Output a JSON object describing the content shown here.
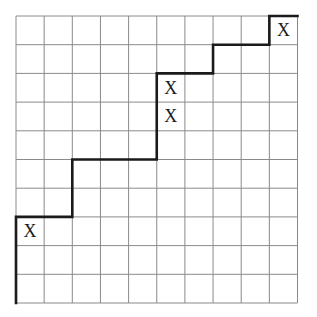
{
  "diagram": {
    "type": "lattice-path-grid",
    "grid": {
      "cols": 10,
      "rows": 10,
      "origin_x": 16,
      "origin_y": 16,
      "cell_w": 28.15,
      "cell_h": 28.7,
      "line_color": "#8a8a8a",
      "background": "#ffffff"
    },
    "path": {
      "color": "#1a1a1a",
      "width": 2.6,
      "points": [
        [
          0,
          10
        ],
        [
          0,
          7
        ],
        [
          2,
          7
        ],
        [
          2,
          5
        ],
        [
          5,
          5
        ],
        [
          5,
          2
        ],
        [
          7,
          2
        ],
        [
          7,
          1
        ],
        [
          9,
          1
        ],
        [
          9,
          0
        ],
        [
          10,
          0
        ]
      ]
    },
    "marks": [
      {
        "label": "X",
        "col": 0,
        "row": 7
      },
      {
        "label": "X",
        "col": 5,
        "row": 2
      },
      {
        "label": "X",
        "col": 5,
        "row": 3
      },
      {
        "label": "X",
        "col": 9,
        "row": 0
      }
    ],
    "mark_color": "#1a1a1a"
  }
}
